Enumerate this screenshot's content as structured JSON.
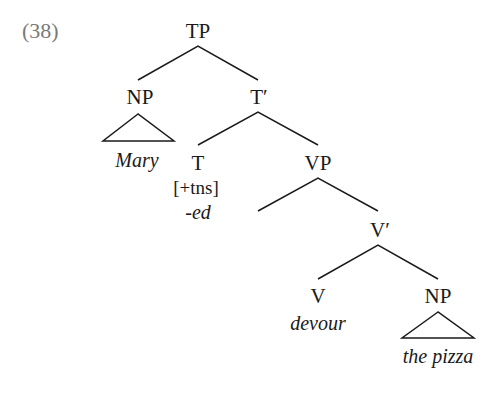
{
  "example_number": "(38)",
  "tree": {
    "root": {
      "label": "TP"
    },
    "subject": {
      "label": "NP",
      "terminal": "Mary"
    },
    "tbar": {
      "label": "T′"
    },
    "t_head": {
      "label": "T",
      "feature": "[+tns]",
      "morpheme": "-ed"
    },
    "vp": {
      "label": "VP"
    },
    "vbar": {
      "label": "V′"
    },
    "v_head": {
      "label": "V",
      "terminal": "devour"
    },
    "object": {
      "label": "NP",
      "terminal": "the pizza"
    }
  }
}
